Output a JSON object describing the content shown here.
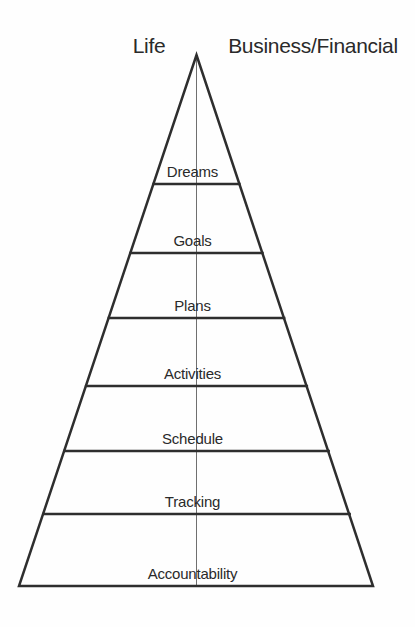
{
  "header": {
    "left_label": "Life",
    "right_label": "Business/Financial"
  },
  "pyramid": {
    "layers": [
      {
        "label": "Dreams"
      },
      {
        "label": "Goals"
      },
      {
        "label": "Plans"
      },
      {
        "label": "Activities"
      },
      {
        "label": "Schedule"
      },
      {
        "label": "Tracking"
      },
      {
        "label": "Accountability"
      }
    ]
  },
  "colors": {
    "outline": "#2e2e2e",
    "divider": "#2e2e2e",
    "center_line": "#6f6f6f",
    "text": "#2a2a2a",
    "background": "#fefefe"
  }
}
